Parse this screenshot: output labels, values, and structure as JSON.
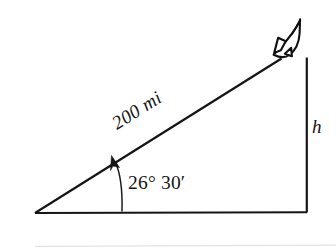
{
  "figure": {
    "background_color": "#ffffff",
    "ink_color": "#151515",
    "labels": {
      "hypotenuse": "200 mi",
      "angle": "26° 30′",
      "opposite_side": "h"
    },
    "icon": {
      "name": "space-shuttle-icon",
      "description": "space shuttle flying up and to the right at the top vertex"
    },
    "geometry": {
      "left_vertex": [
        35,
        213
      ],
      "right_vertex": [
        307,
        212
      ],
      "apex": [
        307,
        57
      ],
      "hypotenuse_end": [
        281,
        58
      ],
      "angle_degrees": 26.5,
      "angle_minutes": 30,
      "hypotenuse_rotation_deg": -32,
      "arc_base_x": 122
    },
    "page_rule": {
      "y": 246,
      "x_start": 35,
      "x_end": 336,
      "color": "#e2e2e2"
    }
  }
}
